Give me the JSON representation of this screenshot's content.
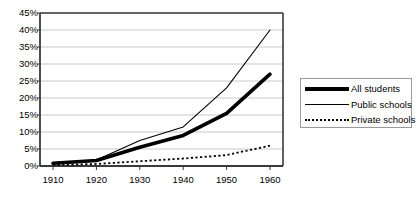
{
  "chart_data": {
    "type": "line",
    "title": "",
    "xlabel": "",
    "ylabel": "",
    "x": [
      1910,
      1920,
      1930,
      1940,
      1950,
      1960
    ],
    "xtick_labels": [
      "1910",
      "1920",
      "1930",
      "1940",
      "1950",
      "1960"
    ],
    "ytick_labels": [
      "0%",
      "5%",
      "10%",
      "15%",
      "20%",
      "25%",
      "30%",
      "35%",
      "40%",
      "45%"
    ],
    "ytick_values": [
      0,
      5,
      10,
      15,
      20,
      25,
      30,
      35,
      40,
      45
    ],
    "ylim": [
      0,
      45
    ],
    "xlim": [
      1907,
      1963
    ],
    "grid": "horizontal",
    "legend_position": "right",
    "series": [
      {
        "name": "All students",
        "style": "thick-solid",
        "color": "#000000",
        "values": [
          0.8,
          1.6,
          5.5,
          9.0,
          15.5,
          27.0
        ]
      },
      {
        "name": "Public schools",
        "style": "thin-solid",
        "color": "#000000",
        "values": [
          0.7,
          1.8,
          7.5,
          11.5,
          23.0,
          40.0
        ]
      },
      {
        "name": "Private schools",
        "style": "dotted",
        "color": "#000000",
        "values": [
          0.3,
          0.6,
          1.4,
          2.2,
          3.2,
          6.0
        ]
      }
    ]
  },
  "legend": {
    "entries": [
      {
        "label": "All students"
      },
      {
        "label": "Public schools"
      },
      {
        "label": "Private schools"
      }
    ]
  },
  "colors": {
    "axis": "#3a3a3a",
    "grid": "#c8c8c8",
    "series": "#000000",
    "legend_border": "#9a9a9a",
    "background": "#ffffff"
  }
}
